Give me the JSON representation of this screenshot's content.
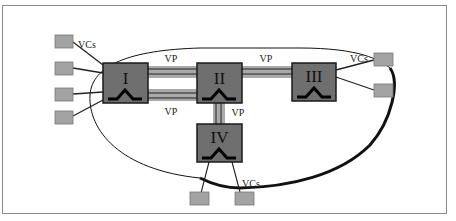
{
  "diagram": {
    "type": "ATM virtual path / virtual circuit network",
    "colors": {
      "switch_fill": "#6f6f6f",
      "switch_border": "#1a1a1a",
      "vp_band": "#a9a9a9",
      "terminal_fill": "#a3a3a3",
      "frame_border": "#8a8a8a",
      "boundary_line": "#111111"
    },
    "switches": [
      {
        "id": "I",
        "label": "I"
      },
      {
        "id": "II",
        "label": "II"
      },
      {
        "id": "III",
        "label": "III"
      },
      {
        "id": "IV",
        "label": "IV"
      }
    ],
    "links": [
      {
        "from": "I",
        "to": "II",
        "label": "VP",
        "position": "top"
      },
      {
        "from": "I",
        "to": "II",
        "label": "VP",
        "position": "bottom"
      },
      {
        "from": "II",
        "to": "III",
        "label": "VP"
      },
      {
        "from": "II",
        "to": "IV",
        "label": "VP"
      }
    ],
    "vc_labels": {
      "left": "VCs",
      "right": "VCs",
      "bottom": "VCs"
    },
    "terminals": {
      "left_count": 4,
      "right_count": 2,
      "bottom_count": 2
    }
  }
}
